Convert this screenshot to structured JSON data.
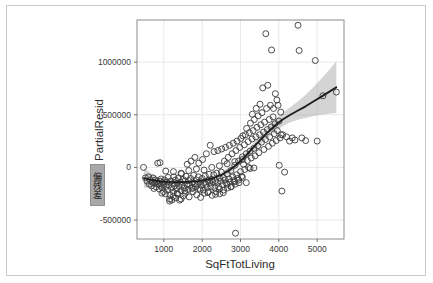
{
  "figure": {
    "background_color": "#ffffff",
    "border_color": "#c9c9c9",
    "panel_background": "#ffffff",
    "grid_color": "#e8e8ee",
    "panel_border_color": "#8c8c8c"
  },
  "annotation": {
    "selected_label": "偏残差",
    "highlight_color": "#a8a8a8",
    "is_selected": true
  },
  "chart_data": {
    "type": "scatter",
    "title": "",
    "subtitle": "",
    "xlabel": "SqFtTotLiving",
    "ylabel": "PartialResid",
    "xlim": [
      300,
      5700
    ],
    "ylim": [
      -680000,
      1400000
    ],
    "xticks": [
      1000,
      2000,
      3000,
      4000,
      5000
    ],
    "xtick_labels": [
      "1000",
      "2000",
      "3000",
      "4000",
      "5000"
    ],
    "yticks": [
      -500000,
      0,
      500000,
      1000000
    ],
    "ytick_labels": [
      "-500000",
      "0",
      "500000",
      "1000000"
    ],
    "grid": true,
    "legend": false,
    "legend_position": "none",
    "marker": {
      "shape": "open-circle",
      "size": 3.0,
      "edge_color": "#3b3b3b",
      "fill_color": "none"
    },
    "smoother": {
      "name": "loess-fit",
      "line_color": "#1c1c1c",
      "line_width": 1.8,
      "band_color": "#b0b0b0",
      "band_opacity": 0.55,
      "x": [
        480,
        700,
        900,
        1100,
        1300,
        1500,
        1700,
        1900,
        2100,
        2300,
        2500,
        2700,
        2900,
        3100,
        3300,
        3500,
        3700,
        3900,
        4100,
        4300,
        4500,
        4700,
        4900,
        5100,
        5300,
        5500
      ],
      "y": [
        -102000,
        -122000,
        -133000,
        -138000,
        -140000,
        -139000,
        -136000,
        -130000,
        -118000,
        -100000,
        -72000,
        -30000,
        25000,
        95000,
        175000,
        255000,
        330000,
        398000,
        455000,
        500000,
        540000,
        580000,
        625000,
        670000,
        715000,
        762000
      ],
      "lower": [
        -196000,
        -178000,
        -166000,
        -160000,
        -155000,
        -152000,
        -150000,
        -146000,
        -138000,
        -124000,
        -100000,
        -62000,
        -8000,
        58000,
        133000,
        208000,
        278000,
        340000,
        392000,
        428000,
        452000,
        470000,
        488000,
        500000,
        510000,
        516000
      ],
      "upper": [
        -8000,
        -66000,
        -100000,
        -116000,
        -125000,
        -126000,
        -122000,
        -114000,
        -98000,
        -76000,
        -44000,
        2000,
        58000,
        132000,
        217000,
        302000,
        382000,
        456000,
        518000,
        572000,
        628000,
        690000,
        762000,
        840000,
        920000,
        1008000
      ]
    },
    "points": [
      [
        470,
        0
      ],
      [
        520,
        -100000
      ],
      [
        560,
        -130000
      ],
      [
        600,
        -90000
      ],
      [
        620,
        -160000
      ],
      [
        650,
        -120000
      ],
      [
        680,
        -175000
      ],
      [
        700,
        -140000
      ],
      [
        720,
        -100000
      ],
      [
        740,
        -200000
      ],
      [
        760,
        -150000
      ],
      [
        780,
        -120000
      ],
      [
        800,
        -185000
      ],
      [
        820,
        -135000
      ],
      [
        840,
        40000
      ],
      [
        860,
        -160000
      ],
      [
        880,
        -205000
      ],
      [
        900,
        -130000
      ],
      [
        910,
        -170000
      ],
      [
        930,
        -110000
      ],
      [
        950,
        -190000
      ],
      [
        970,
        -145000
      ],
      [
        990,
        -230000
      ],
      [
        1000,
        -160000
      ],
      [
        1020,
        -120000
      ],
      [
        1040,
        -250000
      ],
      [
        1060,
        -180000
      ],
      [
        1080,
        -140000
      ],
      [
        1100,
        -215000
      ],
      [
        1110,
        -95000
      ],
      [
        1130,
        -170000
      ],
      [
        1150,
        -300000
      ],
      [
        1160,
        -260000
      ],
      [
        1180,
        -130000
      ],
      [
        1200,
        -195000
      ],
      [
        1210,
        -310000
      ],
      [
        1230,
        -155000
      ],
      [
        1250,
        -235000
      ],
      [
        1260,
        -90000
      ],
      [
        1280,
        -175000
      ],
      [
        1300,
        -120000
      ],
      [
        1310,
        -290000
      ],
      [
        1330,
        -205000
      ],
      [
        1350,
        -150000
      ],
      [
        1360,
        -255000
      ],
      [
        1380,
        -100000
      ],
      [
        1400,
        -180000
      ],
      [
        1410,
        -310000
      ],
      [
        1430,
        -140000
      ],
      [
        1450,
        -220000
      ],
      [
        1460,
        -60000
      ],
      [
        1480,
        -165000
      ],
      [
        1500,
        -115000
      ],
      [
        1510,
        -270000
      ],
      [
        1530,
        -195000
      ],
      [
        1550,
        -130000
      ],
      [
        1560,
        -245000
      ],
      [
        1580,
        -85000
      ],
      [
        1600,
        -160000
      ],
      [
        1610,
        30000
      ],
      [
        1630,
        -210000
      ],
      [
        1650,
        -125000
      ],
      [
        1660,
        -280000
      ],
      [
        1680,
        -170000
      ],
      [
        1700,
        -105000
      ],
      [
        1710,
        60000
      ],
      [
        1730,
        -195000
      ],
      [
        1750,
        -140000
      ],
      [
        1760,
        -230000
      ],
      [
        1780,
        -75000
      ],
      [
        1800,
        -155000
      ],
      [
        1810,
        95000
      ],
      [
        1830,
        -185000
      ],
      [
        1850,
        -120000
      ],
      [
        1860,
        -260000
      ],
      [
        1880,
        -160000
      ],
      [
        1900,
        -90000
      ],
      [
        1910,
        40000
      ],
      [
        1930,
        -200000
      ],
      [
        1950,
        -135000
      ],
      [
        1960,
        -285000
      ],
      [
        1980,
        -170000
      ],
      [
        2000,
        -105000
      ],
      [
        2010,
        75000
      ],
      [
        2030,
        -215000
      ],
      [
        2050,
        -145000
      ],
      [
        2060,
        -245000
      ],
      [
        2080,
        -80000
      ],
      [
        2100,
        -160000
      ],
      [
        2110,
        130000
      ],
      [
        2130,
        -190000
      ],
      [
        2150,
        -125000
      ],
      [
        2160,
        -230000
      ],
      [
        2180,
        -65000
      ],
      [
        2200,
        -150000
      ],
      [
        2210,
        210000
      ],
      [
        2230,
        -180000
      ],
      [
        2250,
        -115000
      ],
      [
        2260,
        -265000
      ],
      [
        2280,
        -140000
      ],
      [
        2300,
        -70000
      ],
      [
        2310,
        150000
      ],
      [
        2330,
        -195000
      ],
      [
        2350,
        -125000
      ],
      [
        2360,
        -230000
      ],
      [
        2380,
        -55000
      ],
      [
        2400,
        -145000
      ],
      [
        2410,
        160000
      ],
      [
        2430,
        -185000
      ],
      [
        2450,
        -100000
      ],
      [
        2460,
        -250000
      ],
      [
        2480,
        -130000
      ],
      [
        2500,
        -45000
      ],
      [
        2510,
        175000
      ],
      [
        2530,
        -165000
      ],
      [
        2550,
        -95000
      ],
      [
        2560,
        -215000
      ],
      [
        2580,
        60000
      ],
      [
        2600,
        -120000
      ],
      [
        2610,
        190000
      ],
      [
        2630,
        -150000
      ],
      [
        2650,
        -60000
      ],
      [
        2660,
        -195000
      ],
      [
        2680,
        95000
      ],
      [
        2700,
        -110000
      ],
      [
        2710,
        210000
      ],
      [
        2730,
        -140000
      ],
      [
        2750,
        -30000
      ],
      [
        2760,
        -180000
      ],
      [
        2780,
        130000
      ],
      [
        2800,
        -90000
      ],
      [
        2810,
        230000
      ],
      [
        2830,
        -125000
      ],
      [
        2850,
        20000
      ],
      [
        2860,
        -160000
      ],
      [
        2870,
        -625000
      ],
      [
        2880,
        160000
      ],
      [
        2900,
        -70000
      ],
      [
        2910,
        250000
      ],
      [
        2930,
        -105000
      ],
      [
        2950,
        60000
      ],
      [
        2960,
        -145000
      ],
      [
        2980,
        190000
      ],
      [
        3000,
        -40000
      ],
      [
        3010,
        275000
      ],
      [
        3030,
        -85000
      ],
      [
        3050,
        100000
      ],
      [
        3060,
        300000
      ],
      [
        3080,
        30000
      ],
      [
        3100,
        215000
      ],
      [
        3110,
        -20000
      ],
      [
        3130,
        310000
      ],
      [
        3150,
        130000
      ],
      [
        3160,
        370000
      ],
      [
        3180,
        65000
      ],
      [
        3200,
        245000
      ],
      [
        3210,
        0
      ],
      [
        3230,
        330000
      ],
      [
        3250,
        155000
      ],
      [
        3260,
        420000
      ],
      [
        3280,
        90000
      ],
      [
        3300,
        270000
      ],
      [
        3310,
        505000
      ],
      [
        3330,
        350000
      ],
      [
        3350,
        180000
      ],
      [
        3360,
        455000
      ],
      [
        3380,
        110000
      ],
      [
        3400,
        290000
      ],
      [
        3410,
        560000
      ],
      [
        3430,
        380000
      ],
      [
        3450,
        205000
      ],
      [
        3460,
        490000
      ],
      [
        3480,
        140000
      ],
      [
        3500,
        310000
      ],
      [
        3510,
        600000
      ],
      [
        3530,
        405000
      ],
      [
        3550,
        240000
      ],
      [
        3560,
        520000
      ],
      [
        3580,
        755000
      ],
      [
        3600,
        335000
      ],
      [
        3610,
        170000
      ],
      [
        3630,
        430000
      ],
      [
        3650,
        265000
      ],
      [
        3660,
        1270000
      ],
      [
        3680,
        560000
      ],
      [
        3700,
        360000
      ],
      [
        3710,
        780000
      ],
      [
        3730,
        200000
      ],
      [
        3750,
        455000
      ],
      [
        3760,
        290000
      ],
      [
        3780,
        590000
      ],
      [
        3800,
        385000
      ],
      [
        3810,
        1115000
      ],
      [
        3830,
        230000
      ],
      [
        3850,
        480000
      ],
      [
        3860,
        560000
      ],
      [
        3880,
        320000
      ],
      [
        3900,
        415000
      ],
      [
        3910,
        700000
      ],
      [
        3930,
        255000
      ],
      [
        3950,
        640000
      ],
      [
        3960,
        350000
      ],
      [
        3980,
        590000
      ],
      [
        4000,
        440000
      ],
      [
        4010,
        20000
      ],
      [
        4030,
        280000
      ],
      [
        4050,
        525000
      ],
      [
        4060,
        310000
      ],
      [
        4080,
        -225000
      ],
      [
        4100,
        310000
      ],
      [
        4150,
        -45000
      ],
      [
        4200,
        290000
      ],
      [
        4280,
        250000
      ],
      [
        4350,
        280000
      ],
      [
        4420,
        260000
      ],
      [
        4500,
        1350000
      ],
      [
        4530,
        1110000
      ],
      [
        4600,
        280000
      ],
      [
        4700,
        255000
      ],
      [
        4950,
        1015000
      ],
      [
        5000,
        250000
      ],
      [
        5150,
        680000
      ],
      [
        5500,
        715000
      ],
      [
        3150,
        -145000
      ],
      [
        3250,
        -10000
      ],
      [
        3350,
        -5000
      ],
      [
        2950,
        -120000
      ],
      [
        2750,
        -185000
      ],
      [
        2550,
        -240000
      ],
      [
        2350,
        -255000
      ],
      [
        2150,
        -240000
      ],
      [
        1950,
        -215000
      ],
      [
        1750,
        -200000
      ],
      [
        1550,
        -225000
      ],
      [
        1350,
        -245000
      ],
      [
        1150,
        -320000
      ],
      [
        950,
        -245000
      ],
      [
        1450,
        -300000
      ],
      [
        1250,
        -275000
      ],
      [
        2450,
        -205000
      ],
      [
        2650,
        -160000
      ],
      [
        2850,
        -135000
      ],
      [
        3050,
        -95000
      ],
      [
        900,
        45000
      ],
      [
        1050,
        -35000
      ],
      [
        1250,
        -40000
      ],
      [
        1450,
        -55000
      ],
      [
        1650,
        -30000
      ],
      [
        1850,
        -15000
      ],
      [
        2050,
        -25000
      ],
      [
        2250,
        0
      ],
      [
        2450,
        15000
      ],
      [
        2650,
        35000
      ],
      [
        2850,
        55000
      ],
      [
        3050,
        75000
      ]
    ]
  }
}
